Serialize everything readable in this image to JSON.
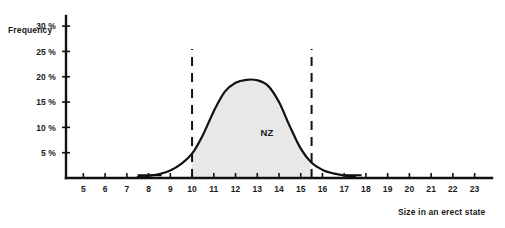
{
  "chart_data": {
    "type": "line",
    "title": "",
    "subtitle": "",
    "xlabel": "Size in an erect state",
    "ylabel": "Frequency",
    "xlim": [
      4.2,
      23.8
    ],
    "ylim": [
      0,
      32
    ],
    "grid": false,
    "legend_position": "inline-annotation",
    "x_ticks": [
      5,
      6,
      7,
      8,
      9,
      10,
      11,
      12,
      13,
      14,
      15,
      16,
      17,
      18,
      19,
      20,
      21,
      22,
      23
    ],
    "x_tick_labels": [
      "5",
      "6",
      "7",
      "8",
      "9",
      "10",
      "11",
      "12",
      "13",
      "14",
      "15",
      "16",
      "17",
      "18",
      "19",
      "20",
      "21",
      "22",
      "23"
    ],
    "y_ticks": [
      5,
      10,
      15,
      20,
      25,
      30
    ],
    "y_tick_labels": [
      "5 %",
      "10 %",
      "15 %",
      "20 %",
      "25 %",
      "30 %"
    ],
    "series": [
      {
        "name": "NZ",
        "label": "NZ",
        "fill_color": "#e8e8e8",
        "line_color": "#111111",
        "x": [
          7.5,
          8.0,
          8.5,
          9.0,
          9.5,
          10.0,
          10.5,
          11.0,
          11.5,
          12.0,
          12.5,
          13.0,
          13.5,
          14.0,
          14.5,
          15.0,
          15.5,
          16.0,
          16.5,
          17.0,
          17.5
        ],
        "values": [
          0.2,
          0.4,
          0.8,
          1.5,
          2.8,
          4.8,
          8.5,
          13.2,
          17.0,
          18.8,
          19.4,
          19.3,
          18.2,
          15.0,
          10.2,
          5.8,
          3.0,
          1.6,
          0.9,
          0.5,
          0.3
        ]
      }
    ],
    "annotations": [
      {
        "name": "series-label",
        "text": "NZ",
        "x": 13.45,
        "y": 8.2
      },
      {
        "name": "left-marker",
        "type": "vertical-dashed-line",
        "x": 10,
        "y_from": 0,
        "y_to": 25.5
      },
      {
        "name": "right-marker",
        "type": "vertical-dashed-line",
        "x": 15.5,
        "y_from": 0,
        "y_to": 25.5
      }
    ],
    "shaded_region": {
      "x_from": 10,
      "x_to": 15.5,
      "color": "#e8e8e8"
    },
    "baseline_stubs": [
      {
        "x_from": 7.5,
        "x_to": 8.6
      },
      {
        "x_from": 17.0,
        "x_to": 17.8
      }
    ]
  },
  "colors": {
    "axis": "#111111",
    "text": "#1a1a1a",
    "fill": "#e8e8e8",
    "background": "#ffffff"
  }
}
